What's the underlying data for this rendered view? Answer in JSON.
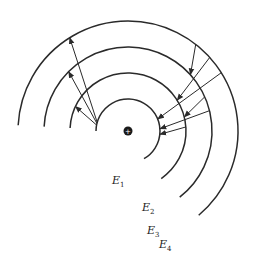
{
  "diagram": {
    "nucleus": {
      "symbol": "+"
    },
    "levels": [
      {
        "id": "E1",
        "label": "E",
        "subscript": "1"
      },
      {
        "id": "E2",
        "label": "E",
        "subscript": "2"
      },
      {
        "id": "E3",
        "label": "E",
        "subscript": "3"
      },
      {
        "id": "E4",
        "label": "E",
        "subscript": "4"
      }
    ],
    "transitions": [
      {
        "from": "E1",
        "to": "E4",
        "direction": "outward"
      },
      {
        "from": "E1",
        "to": "E3",
        "direction": "outward"
      },
      {
        "from": "E1",
        "to": "E2",
        "direction": "outward"
      },
      {
        "from": "E4",
        "to": "E3",
        "direction": "inward"
      },
      {
        "from": "E4",
        "to": "E2",
        "direction": "inward"
      },
      {
        "from": "E4",
        "to": "E1",
        "direction": "inward"
      },
      {
        "from": "E3",
        "to": "E2",
        "direction": "inward"
      },
      {
        "from": "E3",
        "to": "E1",
        "direction": "inward"
      },
      {
        "from": "E2",
        "to": "E1",
        "direction": "inward"
      }
    ]
  }
}
